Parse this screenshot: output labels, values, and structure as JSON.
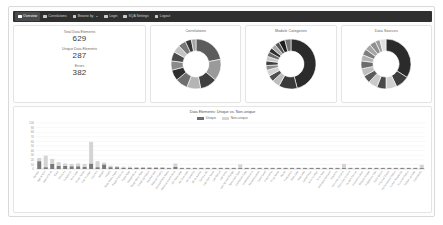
{
  "navbar": {
    "items": [
      {
        "label": "Overview",
        "icon": "grid-icon",
        "active": true,
        "caret": false
      },
      {
        "label": "Correlations",
        "icon": "bars-icon",
        "active": false,
        "caret": false
      },
      {
        "label": "Browse by",
        "icon": "list-icon",
        "active": false,
        "caret": true
      },
      {
        "label": "Login",
        "icon": "share-icon",
        "active": false,
        "caret": false
      },
      {
        "label": "SQA Settings",
        "icon": "gear-icon",
        "active": false,
        "caret": false
      },
      {
        "label": "Logout",
        "icon": "power-icon",
        "active": false,
        "caret": false
      }
    ]
  },
  "stats": [
    {
      "label": "Total Data Elements",
      "value": "629"
    },
    {
      "label": "Unique Data Elements",
      "value": "287"
    },
    {
      "label": "Errors",
      "value": "382"
    }
  ],
  "donuts": [
    {
      "title": "Correlations",
      "slices": [
        {
          "value": 22,
          "color": "#5c5c5c"
        },
        {
          "value": 14,
          "color": "#9a9a9a"
        },
        {
          "value": 11,
          "color": "#3f3f3f"
        },
        {
          "value": 9,
          "color": "#b5b5b5"
        },
        {
          "value": 8,
          "color": "#6f6f6f"
        },
        {
          "value": 7,
          "color": "#2e2e2e"
        },
        {
          "value": 6,
          "color": "#8a8a8a"
        },
        {
          "value": 6,
          "color": "#4a4a4a"
        },
        {
          "value": 5,
          "color": "#c2c2c2"
        },
        {
          "value": 5,
          "color": "#777777"
        },
        {
          "value": 4,
          "color": "#353535"
        },
        {
          "value": 3,
          "color": "#a5a5a5"
        }
      ]
    },
    {
      "title": "Module Categories",
      "slices": [
        {
          "value": 46,
          "color": "#2b2b2b"
        },
        {
          "value": 12,
          "color": "#3a3a3a"
        },
        {
          "value": 5,
          "color": "#bdbdbd"
        },
        {
          "value": 4,
          "color": "#4f4f4f"
        },
        {
          "value": 4,
          "color": "#d2d2d2"
        },
        {
          "value": 3,
          "color": "#8f8f8f"
        },
        {
          "value": 3,
          "color": "#3f3f3f"
        },
        {
          "value": 3,
          "color": "#c8c8c8"
        },
        {
          "value": 3,
          "color": "#6b6b6b"
        },
        {
          "value": 3,
          "color": "#2f2f2f"
        },
        {
          "value": 3,
          "color": "#a8a8a8"
        },
        {
          "value": 3,
          "color": "#555555"
        },
        {
          "value": 4,
          "color": "#1f1f1f"
        },
        {
          "value": 4,
          "color": "#777777"
        }
      ]
    },
    {
      "title": "Data Sources",
      "slices": [
        {
          "value": 34,
          "color": "#2b2b2b"
        },
        {
          "value": 9,
          "color": "#3d3d3d"
        },
        {
          "value": 7,
          "color": "#d0d0d0"
        },
        {
          "value": 6,
          "color": "#4a4a4a"
        },
        {
          "value": 6,
          "color": "#cacaca"
        },
        {
          "value": 5,
          "color": "#5a5a5a"
        },
        {
          "value": 5,
          "color": "#bfbfbf"
        },
        {
          "value": 5,
          "color": "#6b6b6b"
        },
        {
          "value": 4,
          "color": "#b2b2b2"
        },
        {
          "value": 4,
          "color": "#7d7d7d"
        },
        {
          "value": 4,
          "color": "#a6a6a6"
        },
        {
          "value": 4,
          "color": "#8f8f8f"
        },
        {
          "value": 3,
          "color": "#9b9b9b"
        },
        {
          "value": 4,
          "color": "#e0e0e0"
        }
      ]
    }
  ],
  "chart_data": {
    "type": "bar",
    "title": "Data Elements: Unique vs. Non-unique",
    "xlabel": "",
    "ylabel": "",
    "ylim": [
      0,
      100
    ],
    "grid": true,
    "legend_position": "top-center",
    "stacked": true,
    "yticks": [
      "0",
      "10",
      "20",
      "30",
      "40",
      "50",
      "60",
      "70",
      "80",
      "90",
      "100"
    ],
    "series": [
      {
        "name": "Unique",
        "color": "#7a7a7a",
        "values": [
          17,
          4,
          11,
          7,
          7,
          6,
          6,
          5,
          12,
          4,
          10,
          4,
          4,
          3,
          3,
          3,
          3,
          3,
          3,
          3,
          2,
          5,
          2,
          2,
          2,
          2,
          2,
          2,
          2,
          2,
          2,
          2,
          2,
          2,
          2,
          2,
          2,
          2,
          2,
          2,
          2,
          2,
          2,
          2,
          2,
          2,
          2,
          2,
          2,
          2,
          2,
          2,
          2,
          2,
          2,
          2,
          2,
          2,
          2,
          2
        ]
      },
      {
        "name": "Non-unique",
        "color": "#d4d4d4",
        "values": [
          7,
          25,
          11,
          8,
          5,
          5,
          6,
          6,
          47,
          13,
          4,
          3,
          2,
          2,
          2,
          1,
          1,
          1,
          1,
          1,
          1,
          7,
          1,
          1,
          1,
          1,
          1,
          1,
          1,
          1,
          1,
          8,
          1,
          1,
          1,
          1,
          1,
          1,
          1,
          1,
          1,
          1,
          1,
          1,
          1,
          1,
          1,
          9,
          1,
          1,
          1,
          1,
          1,
          1,
          1,
          1,
          1,
          1,
          1,
          7
        ]
      }
    ],
    "categories": [
      "Gender",
      "Age at Visit",
      "Date of Birth",
      "Race",
      "Ethnicity",
      "Subject ID",
      "Visit Date",
      "Study Name",
      "Site Number",
      "Country",
      "Weight",
      "Height",
      "Body Mass Index",
      "Blood Pressure",
      "Heart Rate",
      "Temperature",
      "Respiratory Rate",
      "Smoking Status",
      "Alcohol Use",
      "Medical History",
      "Concomitant Meds",
      "Adverse Event Term",
      "AE Start Date",
      "AE End Date",
      "AE Severity",
      "AE Outcome",
      "Serious AE",
      "Lab Test Name",
      "Lab Result",
      "Lab Units",
      "Lab Normal Range",
      "Specimen Type",
      "Collection Date",
      "Treatment Arm",
      "Randomization",
      "Dose Level",
      "Dose Units",
      "Drug Name",
      "Route",
      "Frequency",
      "Start Date",
      "Stop Date",
      "Compliance",
      "Visit Number",
      "Visit Type",
      "Informed Consent",
      "Eligibility",
      "Inclusion Criteria",
      "Exclusion Criteria",
      "Screen Failure",
      "Discontinuation",
      "Reason Ended",
      "Pregnancy Test",
      "ECG Result",
      "Physical Exam",
      "Performance Status",
      "Tumor Response",
      "Survival Status",
      "Follow-up Date",
      "Comments"
    ]
  }
}
